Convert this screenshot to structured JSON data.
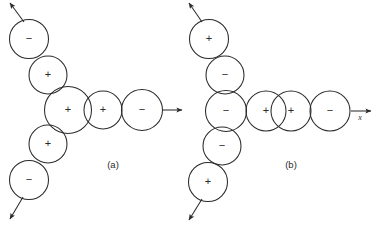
{
  "figure": {
    "background_color": "#ffffff",
    "stroke_color": "#2b2b2b",
    "width": 374,
    "height": 226,
    "panels": [
      {
        "id": "a",
        "caption": "(a)",
        "caption_x": 113,
        "caption_y": 168,
        "axis_label": "",
        "circles": [
          {
            "name": "a-chain-upper-1",
            "sign": "−",
            "cx": 29,
            "cy": 39,
            "r": 19.5
          },
          {
            "name": "a-chain-upper-2",
            "sign": "+",
            "cx": 48,
            "cy": 75,
            "r": 19.0
          },
          {
            "name": "a-center",
            "sign": "+",
            "cx": 68,
            "cy": 110,
            "r": 23.5
          },
          {
            "name": "a-chain-lower-1",
            "sign": "+",
            "cx": 48,
            "cy": 144,
            "r": 19.0
          },
          {
            "name": "a-chain-lower-2",
            "sign": "−",
            "cx": 29,
            "cy": 180,
            "r": 19.5
          },
          {
            "name": "a-row-2",
            "sign": "+",
            "cx": 103,
            "cy": 110,
            "r": 19.0
          },
          {
            "name": "a-row-3",
            "sign": "−",
            "cx": 142,
            "cy": 110,
            "r": 20.5
          }
        ],
        "arrows": [
          {
            "name": "a-arrow-upper-left",
            "x1": 24,
            "y1": 22,
            "x2": 10,
            "y2": 3
          },
          {
            "name": "a-arrow-lower-left",
            "x1": 23,
            "y1": 197,
            "x2": 10,
            "y2": 219
          },
          {
            "name": "a-arrow-right",
            "x1": 163,
            "y1": 110,
            "x2": 182,
            "y2": 110
          }
        ]
      },
      {
        "id": "b",
        "caption": "(b)",
        "caption_x": 291,
        "caption_y": 168,
        "axis_label": "x",
        "axis_label_x": 360,
        "axis_label_y": 120,
        "circles": [
          {
            "name": "b-chain-upper-1",
            "sign": "+",
            "cx": 209,
            "cy": 39,
            "r": 19.5
          },
          {
            "name": "b-chain-upper-2",
            "sign": "−",
            "cx": 225,
            "cy": 75,
            "r": 19.0
          },
          {
            "name": "b-center",
            "sign": "−",
            "cx": 226,
            "cy": 111,
            "r": 20.5
          },
          {
            "name": "b-chain-lower-1",
            "sign": "−",
            "cx": 222,
            "cy": 146,
            "r": 19.0
          },
          {
            "name": "b-chain-lower-2",
            "sign": "+",
            "cx": 208,
            "cy": 182,
            "r": 19.5
          },
          {
            "name": "b-row-2",
            "sign": "+",
            "cx": 266,
            "cy": 111,
            "r": 20.0
          },
          {
            "name": "b-row-3",
            "sign": "+",
            "cx": 291,
            "cy": 111,
            "r": 20.0
          },
          {
            "name": "b-row-4",
            "sign": "−",
            "cx": 330,
            "cy": 111,
            "r": 20.0
          }
        ],
        "arrows": [
          {
            "name": "b-arrow-upper-left",
            "x1": 202,
            "y1": 22,
            "x2": 189,
            "y2": 3
          },
          {
            "name": "b-arrow-lower-left",
            "x1": 202,
            "y1": 199,
            "x2": 189,
            "y2": 220
          },
          {
            "name": "b-arrow-right",
            "x1": 351,
            "y1": 111,
            "x2": 371,
            "y2": 111
          }
        ]
      }
    ]
  }
}
